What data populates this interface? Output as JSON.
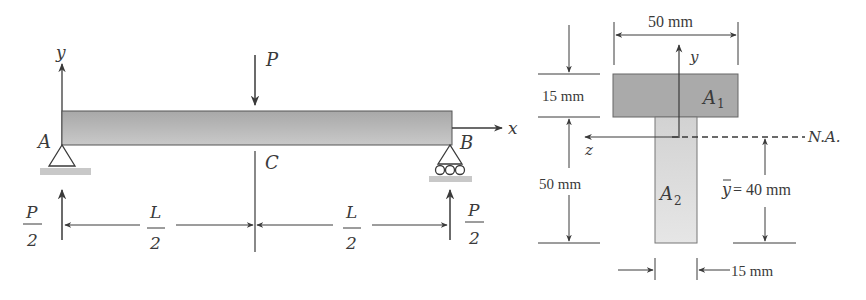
{
  "beam_diagram": {
    "axis_y_label": "y",
    "axis_x_label": "x",
    "load_label": "P",
    "support_a_label": "A",
    "support_b_label": "B",
    "midpoint_label": "C",
    "reaction_left": {
      "num": "P",
      "den": "2"
    },
    "reaction_right": {
      "num": "P",
      "den": "2"
    },
    "span_left": {
      "num": "L",
      "den": "2"
    },
    "span_right": {
      "num": "L",
      "den": "2"
    }
  },
  "cross_section": {
    "flange_width": "50 mm",
    "flange_thickness": "15 mm",
    "web_height": "50 mm",
    "web_thickness": "15 mm",
    "centroid_label": "y",
    "centroid_value": "= 40 mm",
    "area_top_label": "A",
    "area_top_sub": "1",
    "area_bottom_label": "A",
    "area_bottom_sub": "2",
    "neutral_axis_label": "N.A.",
    "axis_y_label": "y",
    "axis_z_label": "z"
  },
  "colors": {
    "line": "#3a3a3a",
    "beam_fill": "#b4b4b4",
    "flange_fill": "#a9a9a9",
    "web_fill": "#dcdcdc",
    "ground_fill": "#c8c8c8"
  }
}
